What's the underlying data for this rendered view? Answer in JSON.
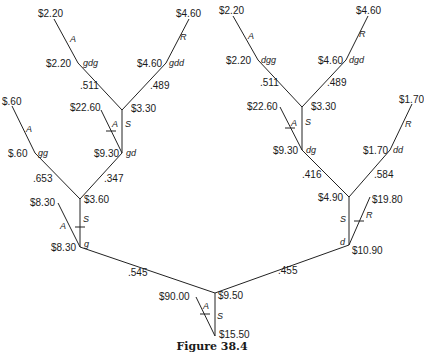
{
  "caption": "Figure 38.4",
  "root": {
    "value": "$9.50",
    "stop_value": "$15.50",
    "stop_label": "S",
    "alt_value": "$90.00",
    "alt_label": "A"
  },
  "left_tree": {
    "prob": ".545",
    "node_g": {
      "state": "g",
      "value": "$8.30",
      "alt_value": "$8.30",
      "alt_label": "A",
      "cont_label": "S",
      "next_value": "$3.60"
    },
    "p_gg": ".653",
    "p_gd": ".347",
    "node_gg": {
      "state": "gg",
      "value": "$.60",
      "alt_label": "A",
      "end_value": "$.60"
    },
    "node_gd": {
      "state": "gd",
      "value": "$9.30",
      "cont_label": "S",
      "alt_label": "A",
      "alt_value": "$22.60",
      "next_value": "$3.30"
    },
    "p_gdg": ".511",
    "p_gdd": ".489",
    "node_gdg": {
      "state": "gdg",
      "value": "$2.20",
      "label": "A",
      "end_value": "$2.20"
    },
    "node_gdd": {
      "state": "gdd",
      "value": "$4.60",
      "label": "R",
      "end_value": "$4.60"
    }
  },
  "right_tree": {
    "prob": ".455",
    "node_d": {
      "state": "d",
      "value": "$10.90",
      "alt_value": "$19.80",
      "alt_label": "R",
      "cont_label": "S",
      "next_value": "$4.90"
    },
    "p_dg": ".416",
    "p_dd": ".584",
    "node_dd": {
      "state": "dd",
      "value": "$1.70",
      "label": "R",
      "end_value": "$1.70"
    },
    "node_dg": {
      "state": "dg",
      "value": "$9.30",
      "cont_label": "S",
      "alt_label": "A",
      "alt_value": "$22.60",
      "next_value": "$3.30"
    },
    "p_dgg": ".511",
    "p_dgd": ".489",
    "node_dgg": {
      "state": "dgg",
      "value": "$2.20",
      "label": "A",
      "end_value": "$2.20"
    },
    "node_dgd": {
      "state": "dgd",
      "value": "$4.60",
      "label": "R",
      "end_value": "$4.60"
    }
  }
}
